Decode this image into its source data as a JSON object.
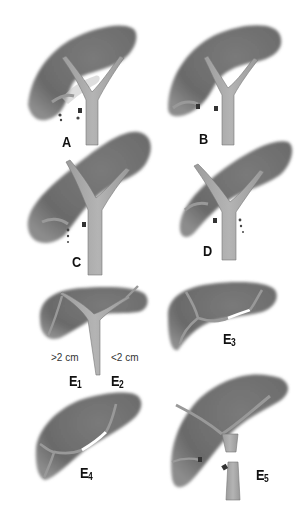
{
  "figure": {
    "panels": [
      {
        "id": "A",
        "label": "A",
        "sub": ""
      },
      {
        "id": "B",
        "label": "B",
        "sub": ""
      },
      {
        "id": "C",
        "label": "C",
        "sub": ""
      },
      {
        "id": "D",
        "label": "D",
        "sub": ""
      },
      {
        "id": "E1",
        "label": "E",
        "sub": "1"
      },
      {
        "id": "E2",
        "label": "E",
        "sub": "2"
      },
      {
        "id": "E3",
        "label": "E",
        "sub": "3"
      },
      {
        "id": "E4",
        "label": "E",
        "sub": "4"
      },
      {
        "id": "E5",
        "label": "E",
        "sub": "5"
      }
    ],
    "measurements": {
      "left": ">2 cm",
      "right": "<2 cm"
    },
    "colors": {
      "liver": "#6e6e6e",
      "liver_edge": "#9a9a9a",
      "duct": "#a8a8a8",
      "duct_outline": "#707070",
      "bile_drop": "#555555",
      "clip": "#444444",
      "label": "#111111"
    }
  }
}
